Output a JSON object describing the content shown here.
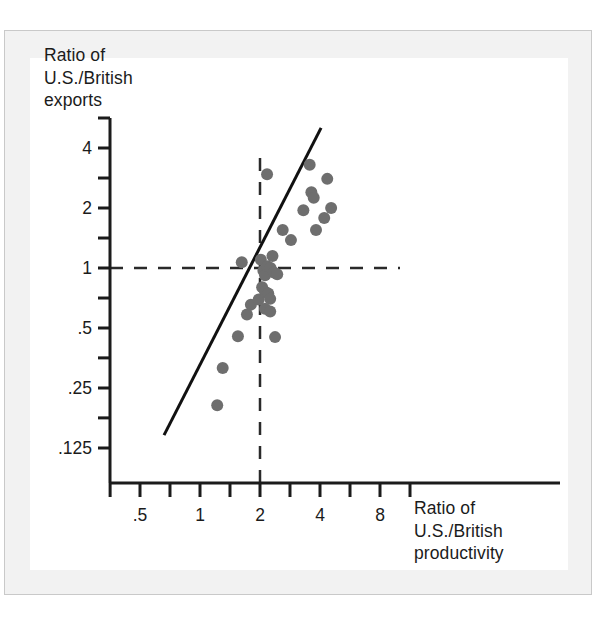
{
  "figure": {
    "background_color": "#ffffff",
    "frame_color": "#f2f2f2",
    "plate_color": "#ffffff"
  },
  "chart_data": {
    "type": "scatter",
    "title": "",
    "subtitle": "",
    "xlabel": "Ratio of\nU.S./British\nproductivity",
    "ylabel": "Ratio of\nU.S./British\nexports",
    "xlabel_lines": [
      "Ratio of",
      "U.S./British",
      "productivity"
    ],
    "ylabel_lines": [
      "Ratio of",
      "U.S./British",
      "exports"
    ],
    "xscale": "log",
    "yscale": "log",
    "xlim": [
      0.35,
      11.3
    ],
    "ylim": [
      0.088,
      5.66
    ],
    "xticks": [
      0.5,
      1,
      2,
      4,
      8
    ],
    "xtick_labels": [
      ".5",
      "1",
      "2",
      "4",
      "8"
    ],
    "x_minor_ticks": [
      0.707,
      1.414,
      2.828,
      5.657,
      11.314
    ],
    "yticks": [
      0.125,
      0.25,
      0.5,
      1,
      2,
      4
    ],
    "ytick_labels": [
      ".125",
      ".25",
      ".5",
      "1",
      "2",
      "4"
    ],
    "y_minor_ticks": [
      0.177,
      0.354,
      0.707,
      1.414,
      2.828,
      5.657
    ],
    "grid": false,
    "legend": null,
    "point_color": "#6e6e6e",
    "point_radius_px": 6,
    "marker": "circle",
    "series": [
      {
        "name": "country pairs",
        "points": [
          [
            1.22,
            0.205
          ],
          [
            1.3,
            0.315
          ],
          [
            1.55,
            0.455
          ],
          [
            1.72,
            0.585
          ],
          [
            1.8,
            0.655
          ],
          [
            1.97,
            0.695
          ],
          [
            1.62,
            1.07
          ],
          [
            2.02,
            1.1
          ],
          [
            2.08,
            0.97
          ],
          [
            2.12,
            0.92
          ],
          [
            2.05,
            0.8
          ],
          [
            2.12,
            0.76
          ],
          [
            2.2,
            0.745
          ],
          [
            2.25,
            0.7
          ],
          [
            2.12,
            0.625
          ],
          [
            2.25,
            0.605
          ],
          [
            2.18,
            1.02
          ],
          [
            2.26,
            1.0
          ],
          [
            2.31,
            1.15
          ],
          [
            2.35,
            0.95
          ],
          [
            2.44,
            0.93
          ],
          [
            2.17,
            2.95
          ],
          [
            2.38,
            0.45
          ],
          [
            2.6,
            1.55
          ],
          [
            2.86,
            1.38
          ],
          [
            3.3,
            1.95
          ],
          [
            3.55,
            3.3
          ],
          [
            3.62,
            2.4
          ],
          [
            3.72,
            2.25
          ],
          [
            3.82,
            1.55
          ],
          [
            4.2,
            1.78
          ],
          [
            4.35,
            2.8
          ],
          [
            4.55,
            2.0
          ]
        ]
      }
    ],
    "fit_line": {
      "name": "regression-line",
      "color": "#111111",
      "width_px": 3,
      "x_start": 0.66,
      "y_start": 0.145,
      "x_end": 4.05,
      "y_end": 5.05
    },
    "reference_lines": [
      {
        "name": "horizontal-unity-line",
        "orientation": "horizontal",
        "value": 1,
        "style": "dashed",
        "color": "#2a2a2a"
      },
      {
        "name": "vertical-reference-line",
        "orientation": "vertical",
        "value": 2,
        "style": "dashed",
        "color": "#2a2a2a"
      }
    ],
    "axis_color": "#1b1b1b",
    "axis_width_px": 3
  }
}
